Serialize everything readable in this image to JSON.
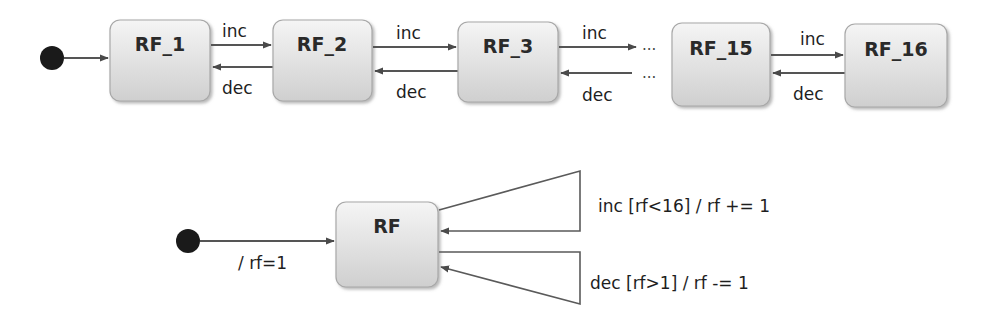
{
  "diagram": {
    "top": {
      "states": [
        {
          "id": "rf1",
          "label": "RF_1"
        },
        {
          "id": "rf2",
          "label": "RF_2"
        },
        {
          "id": "rf3",
          "label": "RF_3"
        },
        {
          "id": "rf15",
          "label": "RF_15"
        },
        {
          "id": "rf16",
          "label": "RF_16"
        }
      ],
      "transitions": {
        "inc": "inc",
        "dec": "dec"
      },
      "ellipsis": "..."
    },
    "bottom": {
      "state": {
        "label": "RF"
      },
      "initial_label": "/ rf=1",
      "inc_loop_label": "inc [rf<16] / rf += 1",
      "dec_loop_label": "dec [rf>1] / rf -= 1"
    },
    "colors": {
      "state_fill_top": "#f4f4f4",
      "state_fill_bottom": "#d2d2d2",
      "state_border": "#a8a8a8",
      "edge": "#555555",
      "initial_node": "#1a1a1a"
    }
  }
}
